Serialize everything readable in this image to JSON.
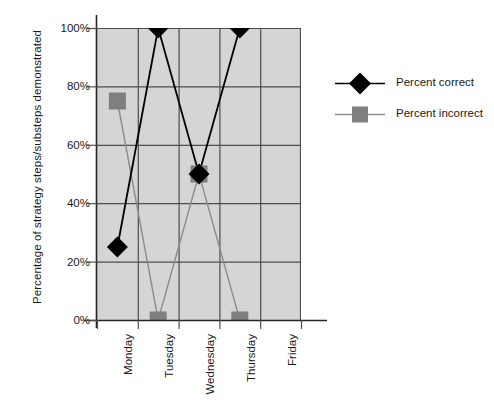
{
  "chart_data": {
    "type": "line",
    "title": "",
    "xlabel": "",
    "ylabel": "Percentage of strategy steps/substeps demonstrated",
    "categories": [
      "Monday",
      "Tuesday",
      "Wednesday",
      "Thursday",
      "Friday"
    ],
    "series": [
      {
        "name": "Percent correct",
        "marker": "diamond",
        "color": "#000000",
        "values": [
          25,
          100,
          50,
          100,
          null
        ]
      },
      {
        "name": "Percent incorrect",
        "marker": "square",
        "color": "#808080",
        "values": [
          75,
          0,
          50,
          0,
          null
        ]
      }
    ],
    "ylim": [
      0,
      100
    ],
    "y_ticks": [
      "0%",
      "20%",
      "40%",
      "60%",
      "80%",
      "100%"
    ],
    "y_tick_values": [
      0,
      20,
      40,
      60,
      80,
      100
    ],
    "grid": true,
    "legend_position": "right",
    "plot_background": "#d5d5d5",
    "grid_color": "#4d4d4d"
  },
  "legend": {
    "items": [
      {
        "label": "Percent correct"
      },
      {
        "label": "Percent incorrect"
      }
    ]
  }
}
